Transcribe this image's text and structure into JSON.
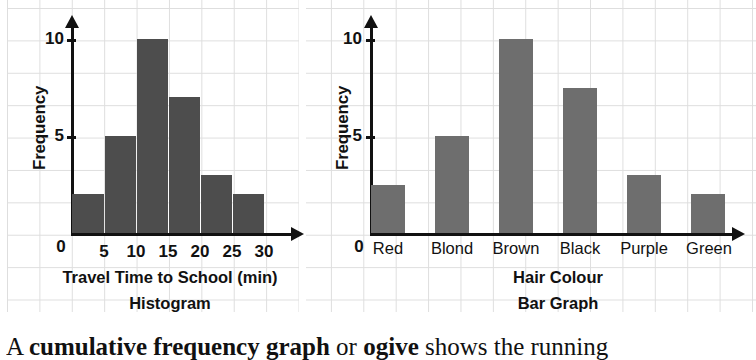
{
  "page": {
    "background_color": "#ffffff",
    "grid_color": "#dedede"
  },
  "body_text": {
    "segments": [
      {
        "text": "A ",
        "bold": false
      },
      {
        "text": "cumulative frequency graph",
        "bold": true
      },
      {
        "text": " or ",
        "bold": false
      },
      {
        "text": "ogive",
        "bold": true
      },
      {
        "text": " shows the running",
        "bold": false
      }
    ]
  },
  "figures": [
    {
      "id": "histogram",
      "caption": "Histogram",
      "x_axis_title": "Travel Time to School (min)",
      "y_axis_title": "Frequency",
      "origin_label": "0",
      "bar_color": "#4d4d4d"
    },
    {
      "id": "bargraph",
      "caption": "Bar Graph",
      "x_axis_title": "Hair Colour",
      "y_axis_title": "Frequency",
      "origin_label": "0",
      "bar_color": "#6e6e6e"
    }
  ],
  "chart_data": [
    {
      "type": "bar",
      "title": "Histogram",
      "xlabel": "Travel Time to School (min)",
      "ylabel": "Frequency",
      "bin_edges": [
        0,
        5,
        10,
        15,
        20,
        25,
        30
      ],
      "x_tick_labels": [
        "0",
        "5",
        "10",
        "15",
        "20",
        "25",
        "30"
      ],
      "categories": [
        "0-5",
        "5-10",
        "10-15",
        "15-20",
        "20-25",
        "25-30"
      ],
      "values": [
        2,
        5,
        10,
        7,
        3,
        2
      ],
      "y_tick_labels": [
        "5",
        "10"
      ],
      "y_ticks": [
        5,
        10
      ],
      "ylim": [
        0,
        11
      ],
      "grid": true,
      "legend": "none",
      "bar_color": "#4d4d4d"
    },
    {
      "type": "bar",
      "title": "Bar Graph",
      "xlabel": "Hair Colour",
      "ylabel": "Frequency",
      "categories": [
        "Red",
        "Blond",
        "Brown",
        "Black",
        "Purple",
        "Green"
      ],
      "values": [
        2.5,
        5,
        10,
        7.5,
        3,
        2
      ],
      "y_tick_labels": [
        "5",
        "10"
      ],
      "y_ticks": [
        5,
        10
      ],
      "ylim": [
        0,
        11
      ],
      "grid": true,
      "legend": "none",
      "bar_color": "#6e6e6e"
    }
  ]
}
